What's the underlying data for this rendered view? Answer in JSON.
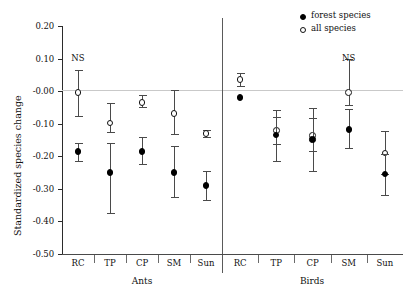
{
  "chart_data": {
    "type": "scatter",
    "title": "",
    "xlabel": "",
    "ylabel": "Standardized species change",
    "ylim": [
      -0.5,
      0.2
    ],
    "yticks": [
      0.2,
      0.1,
      -0.0,
      -0.1,
      -0.2,
      -0.3,
      -0.4,
      -0.5
    ],
    "ytick_labels": [
      "0.20",
      "0.10",
      "-0.00",
      "-0.10",
      "-0.20",
      "-0.30",
      "-0.40",
      "-0.50"
    ],
    "grid": false,
    "zero_reference_line": true,
    "legend_position": "top-right",
    "legend": [
      {
        "name": "forest species",
        "marker": "filled-circle"
      },
      {
        "name": "all species",
        "marker": "open-circle"
      }
    ],
    "panels": [
      {
        "name": "Ants",
        "categories": [
          "RC",
          "TP",
          "CP",
          "SM",
          "Sun"
        ],
        "series": [
          {
            "name": "all species",
            "marker": "open-circle",
            "values": [
              -0.005,
              -0.098,
              -0.035,
              -0.068,
              -0.13
            ],
            "ci_low": [
              -0.075,
              -0.125,
              -0.048,
              -0.132,
              -0.14
            ],
            "ci_high": [
              0.065,
              -0.035,
              -0.012,
              0.002,
              -0.118
            ]
          },
          {
            "name": "forest species",
            "marker": "filled-circle",
            "values": [
              -0.185,
              -0.25,
              -0.185,
              -0.25,
              -0.29
            ],
            "ci_low": [
              -0.215,
              -0.375,
              -0.225,
              -0.325,
              -0.335
            ],
            "ci_high": [
              -0.158,
              -0.16,
              -0.142,
              -0.168,
              -0.245
            ]
          }
        ],
        "annotations": [
          {
            "text": "NS",
            "category": "RC",
            "y": 0.098
          }
        ]
      },
      {
        "name": "Birds",
        "categories": [
          "RC",
          "TP",
          "CP",
          "SM",
          "Sun"
        ],
        "series": [
          {
            "name": "all species",
            "marker": "open-circle",
            "values": [
              0.035,
              -0.12,
              -0.135,
              -0.005,
              -0.19
            ],
            "ci_low": [
              0.015,
              -0.162,
              -0.185,
              -0.042,
              -0.255
            ],
            "ci_high": [
              0.055,
              -0.078,
              -0.082,
              0.098,
              -0.122
            ]
          },
          {
            "name": "forest species",
            "marker": "filled-circle",
            "values": [
              -0.02,
              -0.135,
              -0.148,
              -0.118,
              -0.255
            ],
            "ci_low": [
              -0.02,
              -0.215,
              -0.245,
              -0.175,
              -0.32
            ],
            "ci_high": [
              -0.02,
              -0.058,
              -0.052,
              -0.055,
              -0.192
            ]
          }
        ],
        "annotations": [
          {
            "text": "NS",
            "category": "SM",
            "y": 0.098
          }
        ]
      }
    ]
  },
  "axis": {
    "ylabel": "Standardized species change",
    "ytick_labels": [
      "0.20",
      "0.10",
      "-0.00",
      "-0.10",
      "-0.20",
      "-0.30",
      "-0.40",
      "-0.50"
    ]
  },
  "panels": {
    "ants_label": "Ants",
    "birds_label": "Birds"
  },
  "categories": {
    "ants": [
      "RC",
      "TP",
      "CP",
      "SM",
      "Sun"
    ],
    "birds": [
      "RC",
      "TP",
      "CP",
      "SM",
      "Sun"
    ]
  },
  "legend": {
    "forest": "forest species",
    "all": "all species"
  },
  "annotations": {
    "ns_ants": "NS",
    "ns_birds": "NS"
  },
  "colors": {
    "marker_fill": "#000000",
    "marker_open": "#ffffff",
    "axis": "#2b2b2b",
    "zero_line": "#c9c9c9",
    "background": "#ffffff"
  }
}
